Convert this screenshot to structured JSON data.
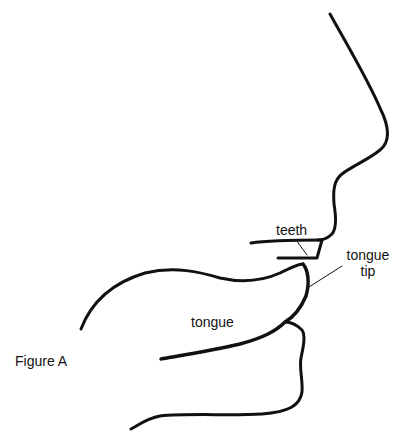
{
  "figure": {
    "caption": "Figure A",
    "labels": {
      "teeth": "teeth",
      "tongue_tip_line1": "tongue",
      "tongue_tip_line2": "tip",
      "tongue": "tongue"
    },
    "colors": {
      "stroke": "#111111",
      "background": "#ffffff"
    }
  }
}
